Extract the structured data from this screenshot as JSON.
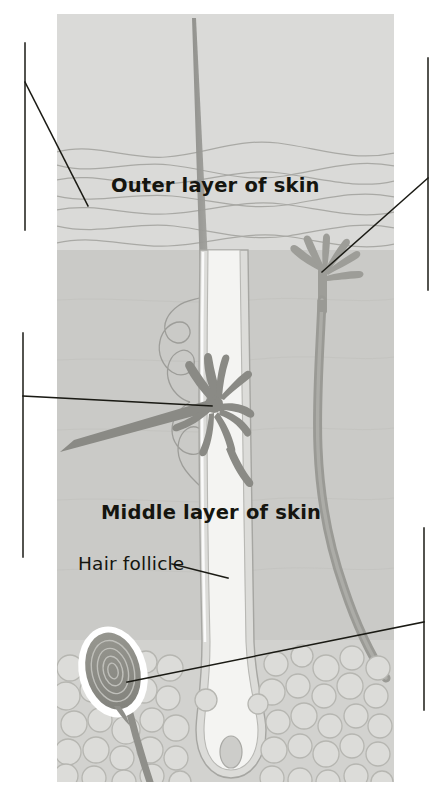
{
  "figure": {
    "panel": {
      "x": 57,
      "y": 14,
      "width": 337,
      "height": 768
    },
    "background_color": "#ffffff",
    "colors": {
      "epidermis": "#d8d8d6",
      "dermis": "#c9c9c6",
      "hypodermis": "#cfcfcc",
      "fat_cell_fill": "#d9d9d6",
      "fat_cell_stroke": "#b4b4b0",
      "hair_shaft": "#9a9a96",
      "nerve_light": "#a0a09c",
      "nerve_dark": "#8b8b87",
      "corpuscle_dark": "#8d8d89",
      "corpuscle_highlight": "#ffffff",
      "follicle_inner": "#f2f2f0",
      "leader_line": "#1a1a14",
      "wavy_line": "#a8a8a4",
      "text": "#15150f"
    }
  },
  "labels": [
    {
      "id": "outer-layer-of-skin",
      "text": "Outer layer of skin",
      "weight": "bold",
      "x": 111,
      "y": 192
    },
    {
      "id": "middle-layer-of-skin",
      "text": "Middle layer of skin",
      "weight": "bold",
      "x": 101,
      "y": 519
    },
    {
      "id": "hair-follicle",
      "text": "Hair follicle",
      "weight": "regular",
      "x": 78,
      "y": 570
    }
  ],
  "leaders": [
    {
      "id": "leader-top-left",
      "side": "left",
      "rule": {
        "x": 25,
        "y1": 43,
        "y2": 230
      },
      "pointer": {
        "x1": 25,
        "y1": 82,
        "x2": 88,
        "y2": 206
      }
    },
    {
      "id": "leader-mid-left",
      "side": "left",
      "rule": {
        "x": 23,
        "y1": 333,
        "y2": 557
      },
      "pointer": {
        "x1": 23,
        "y1": 396,
        "x2": 212,
        "y2": 406
      }
    },
    {
      "id": "leader-top-right",
      "side": "right",
      "rule": {
        "x": 428,
        "y1": 58,
        "y2": 290
      },
      "pointer": {
        "x1": 428,
        "y1": 178,
        "x2": 322,
        "y2": 272
      }
    },
    {
      "id": "leader-bottom-right",
      "side": "right",
      "rule": {
        "x": 424,
        "y1": 528,
        "y2": 710
      },
      "pointer": {
        "x1": 424,
        "y1": 622,
        "x2": 127,
        "y2": 682
      }
    },
    {
      "id": "leader-hair-follicle",
      "side": "inline",
      "pointer": {
        "x1": 172,
        "y1": 564,
        "x2": 228,
        "y2": 578
      }
    }
  ],
  "structures": [
    {
      "id": "hair-shaft",
      "name": "hair-shaft",
      "description": "Tapering hair shaft rising from follicle through skin surface"
    },
    {
      "id": "hair-follicle",
      "name": "hair-follicle",
      "description": "Tubular sheath surrounding the hair root ending in a bulb"
    },
    {
      "id": "epidermis",
      "name": "outer-layer-of-skin",
      "description": "Wavy banded outer skin layer"
    },
    {
      "id": "dermis",
      "name": "middle-layer-of-skin",
      "description": "Middle skin layer containing nerves and glands"
    },
    {
      "id": "fat-layer",
      "name": "fat-cell-layer",
      "description": "Cluster of rounded fat cells beneath the dermis"
    },
    {
      "id": "nerve-ending-upper",
      "name": "free-nerve-ending",
      "description": "Fan-shaped nerve ending terminating near the skin surface"
    },
    {
      "id": "nerve-ending-follicle",
      "name": "follicle-nerve-ending",
      "description": "Nerve ending wrapping around the hair follicle"
    },
    {
      "id": "pacinian-corpuscle",
      "name": "pacinian-corpuscle",
      "description": "Concentric onion-layered pressure receptor in the fat layer"
    },
    {
      "id": "nerve-trunk",
      "name": "nerve-trunk",
      "description": "Long nerve fibre running down the right side of the section"
    },
    {
      "id": "sweat-gland-duct",
      "name": "sweat-gland-duct",
      "description": "Coiled duct line in the dermis"
    }
  ]
}
